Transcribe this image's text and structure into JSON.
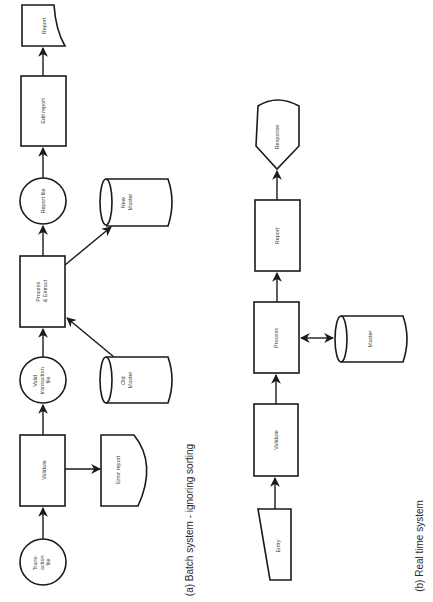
{
  "diagram_a": {
    "caption": "(a) Batch system - ignoring sorting",
    "nodes": {
      "transaction_file": {
        "type": "circle",
        "lines": [
          "Trans-",
          "action",
          "file"
        ]
      },
      "validate": {
        "type": "process",
        "lines": [
          "Validate"
        ]
      },
      "error_report": {
        "type": "document",
        "lines": [
          "Error report"
        ]
      },
      "valid_transaction_file": {
        "type": "circle",
        "lines": [
          "Valid",
          "transaction",
          "file"
        ]
      },
      "old_master": {
        "type": "cylinder",
        "lines": [
          "Old",
          "Master"
        ]
      },
      "process_extract": {
        "type": "process",
        "lines": [
          "Process",
          "& Extract"
        ]
      },
      "new_master": {
        "type": "cylinder",
        "lines": [
          "New",
          "Master"
        ]
      },
      "report_file": {
        "type": "circle",
        "lines": [
          "Report file"
        ]
      },
      "edit_report": {
        "type": "process",
        "lines": [
          "Edit report"
        ]
      },
      "report": {
        "type": "document",
        "lines": [
          "Report"
        ]
      }
    },
    "edges": [
      {
        "from": "Transaction file",
        "to": "Validate"
      },
      {
        "from": "Validate",
        "to": "Error report"
      },
      {
        "from": "Validate",
        "to": "Valid transaction file"
      },
      {
        "from": "Valid transaction file",
        "to": "Process & Extract"
      },
      {
        "from": "Old Master",
        "to": "Process & Extract"
      },
      {
        "from": "Process & Extract",
        "to": "New Master"
      },
      {
        "from": "Process & Extract",
        "to": "Report file"
      },
      {
        "from": "Report file",
        "to": "Edit report"
      },
      {
        "from": "Edit report",
        "to": "Report"
      }
    ]
  },
  "diagram_b": {
    "caption": "(b) Real time system",
    "nodes": {
      "entry": {
        "type": "manual-input",
        "lines": [
          "Entry"
        ]
      },
      "validate": {
        "type": "process",
        "lines": [
          "Validate"
        ]
      },
      "process": {
        "type": "process",
        "lines": [
          "Process"
        ]
      },
      "master": {
        "type": "cylinder",
        "lines": [
          "Master"
        ]
      },
      "report": {
        "type": "process",
        "lines": [
          "Report"
        ]
      },
      "response": {
        "type": "display",
        "lines": [
          "Response"
        ]
      }
    },
    "edges": [
      {
        "from": "Entry",
        "to": "Validate"
      },
      {
        "from": "Validate",
        "to": "Process"
      },
      {
        "from": "Process",
        "to": "Master",
        "bidirectional": true
      },
      {
        "from": "Process",
        "to": "Report"
      },
      {
        "from": "Report",
        "to": "Response"
      }
    ]
  },
  "colors": {
    "stroke": "#1a1a1a",
    "background": "#ffffff",
    "label": "#444444"
  }
}
